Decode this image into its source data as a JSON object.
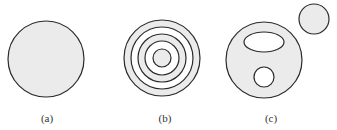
{
  "colors": {
    "fill": "#ebebeb",
    "stroke": "#2a2a2a",
    "hole": "#ffffff"
  },
  "panels": [
    {
      "label": "(a)",
      "description": "single filled disk",
      "shapes": [
        {
          "type": "circle",
          "cx": 46,
          "cy": 59,
          "r": 38,
          "fill": "filled"
        }
      ]
    },
    {
      "label": "(b)",
      "description": "concentric rings",
      "shapes": [
        {
          "type": "circle",
          "cx": 162,
          "cy": 58,
          "r": 38,
          "fill": "filled"
        },
        {
          "type": "circle",
          "cx": 162,
          "cy": 58,
          "r": 31,
          "fill": "hole"
        },
        {
          "type": "circle",
          "cx": 162,
          "cy": 58,
          "r": 24,
          "fill": "filled"
        },
        {
          "type": "circle",
          "cx": 162,
          "cy": 58,
          "r": 17,
          "fill": "hole"
        },
        {
          "type": "circle",
          "cx": 162,
          "cy": 58,
          "r": 9,
          "fill": "filled"
        }
      ]
    },
    {
      "label": "(c)",
      "description": "disk with two holes and a separate disk",
      "shapes": [
        {
          "type": "circle",
          "cx": 264,
          "cy": 60,
          "r": 38,
          "fill": "filled"
        },
        {
          "type": "ellipse",
          "cx": 264,
          "cy": 42,
          "rx": 20,
          "ry": 10,
          "fill": "hole"
        },
        {
          "type": "circle",
          "cx": 264,
          "cy": 77,
          "r": 10,
          "fill": "hole"
        },
        {
          "type": "circle",
          "cx": 314,
          "cy": 19,
          "r": 15,
          "fill": "filled"
        }
      ]
    }
  ],
  "labels": {
    "a": "(a)",
    "b": "(b)",
    "c": "(c)"
  }
}
